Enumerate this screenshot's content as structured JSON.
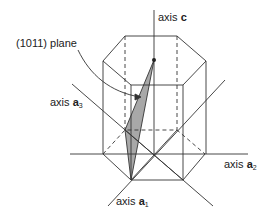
{
  "diagram": {
    "type": "hexagonal prism crystallographic axes",
    "labels": {
      "plane": "(1011) plane",
      "axis_c_prefix": "axis ",
      "axis_c_symbol": "c",
      "axis_a3_prefix": "axis ",
      "axis_a3_symbol": "a",
      "axis_a3_sub": "3",
      "axis_a2_prefix": "axis ",
      "axis_a2_symbol": "a",
      "axis_a2_sub": "2",
      "axis_a1_prefix": "axis ",
      "axis_a1_symbol": "a",
      "axis_a1_sub": "1"
    },
    "colors": {
      "line": "#333333",
      "plane_fill": "#a8a8a8",
      "background": "#ffffff"
    }
  }
}
